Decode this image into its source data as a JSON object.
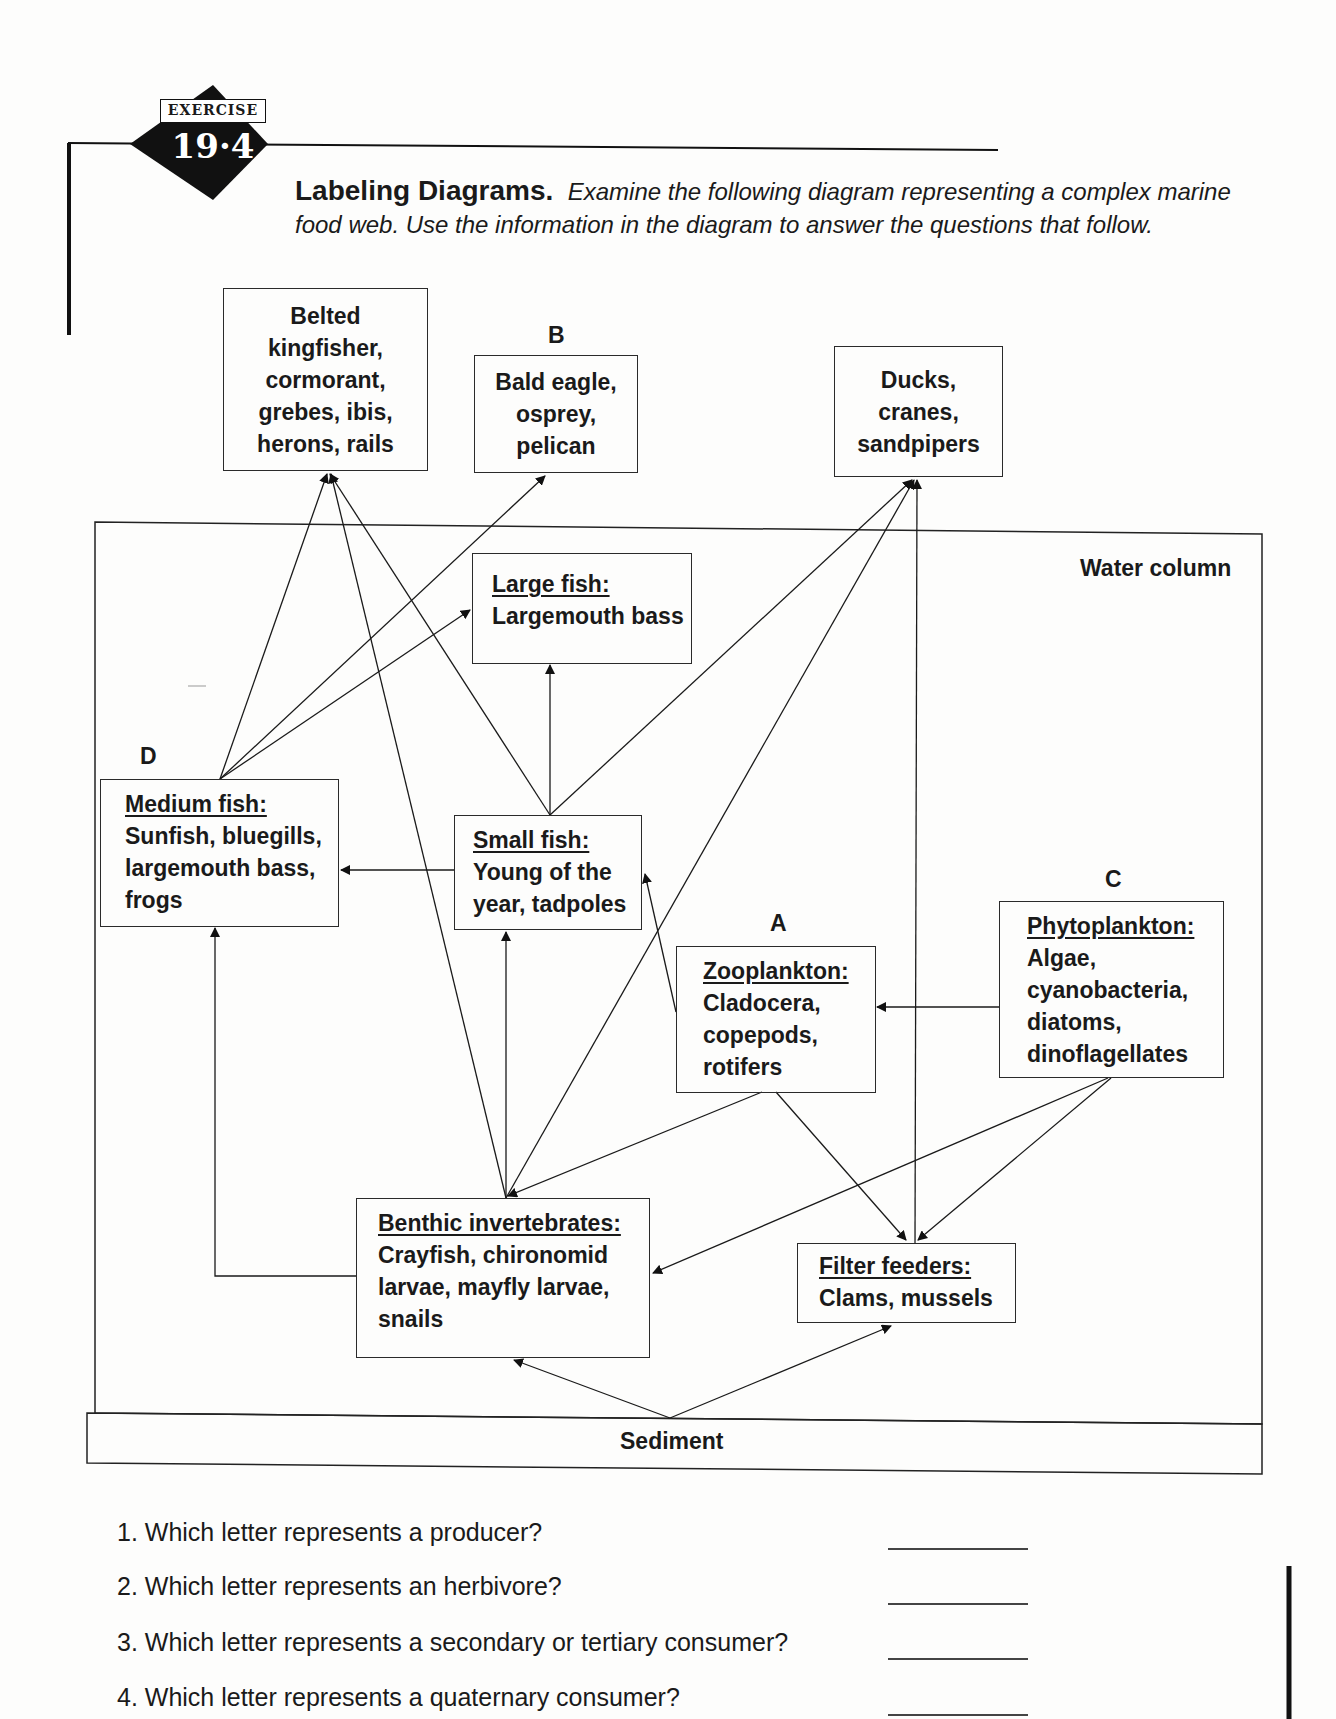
{
  "exercise": {
    "badge_label": "EXERCISE",
    "badge_number": "19·4"
  },
  "instructions": {
    "heading": "Labeling Diagrams.",
    "text": "Examine the following diagram representing a complex marine food web. Use the information in the diagram to answer the questions that follow."
  },
  "diagram": {
    "zones": {
      "water_column": "Water column",
      "sediment": "Sediment"
    },
    "letters": {
      "A": "A",
      "B": "B",
      "C": "C",
      "D": "D"
    },
    "nodes": {
      "belted": {
        "lines": [
          "Belted",
          "kingfisher,",
          "cormorant,",
          "grebes, ibis,",
          "herons, rails"
        ]
      },
      "bald_eagle": {
        "letter": "B",
        "lines": [
          "Bald eagle,",
          "osprey,",
          "pelican"
        ]
      },
      "ducks": {
        "lines": [
          "Ducks,",
          "cranes,",
          "sandpipers"
        ]
      },
      "large_fish": {
        "title": "Large fish:",
        "lines": [
          "Largemouth bass"
        ]
      },
      "medium_fish": {
        "letter": "D",
        "title": "Medium fish:",
        "lines": [
          "Sunfish, bluegills,",
          "largemouth bass,",
          "frogs"
        ]
      },
      "small_fish": {
        "title": "Small fish:",
        "lines": [
          "Young of the",
          "year, tadpoles"
        ]
      },
      "zooplankton": {
        "letter": "A",
        "title": "Zooplankton:",
        "lines": [
          "Cladocera,",
          "copepods,",
          "rotifers"
        ]
      },
      "phytoplankton": {
        "letter": "C",
        "title": "Phytoplankton:",
        "lines": [
          "Algae,",
          "cyanobacteria,",
          "diatoms,",
          "dinoflagellates"
        ]
      },
      "benthic": {
        "title": "Benthic invertebrates:",
        "lines": [
          "Crayfish, chironomid",
          "larvae, mayfly larvae,",
          "snails"
        ]
      },
      "filter": {
        "title": "Filter feeders:",
        "lines": [
          "Clams, mussels"
        ]
      }
    },
    "edges": [
      {
        "from": "medium_fish",
        "to": "belted"
      },
      {
        "from": "medium_fish",
        "to": "bald_eagle"
      },
      {
        "from": "medium_fish",
        "to": "large_fish"
      },
      {
        "from": "small_fish",
        "to": "belted"
      },
      {
        "from": "small_fish",
        "to": "large_fish"
      },
      {
        "from": "small_fish",
        "to": "ducks"
      },
      {
        "from": "small_fish",
        "to": "medium_fish"
      },
      {
        "from": "benthic",
        "to": "belted"
      },
      {
        "from": "benthic",
        "to": "small_fish"
      },
      {
        "from": "benthic",
        "to": "ducks"
      },
      {
        "from": "benthic",
        "to": "medium_fish"
      },
      {
        "from": "zooplankton",
        "to": "small_fish"
      },
      {
        "from": "zooplankton",
        "to": "benthic"
      },
      {
        "from": "zooplankton",
        "to": "filter"
      },
      {
        "from": "phytoplankton",
        "to": "zooplankton"
      },
      {
        "from": "phytoplankton",
        "to": "benthic"
      },
      {
        "from": "phytoplankton",
        "to": "filter"
      },
      {
        "from": "filter",
        "to": "ducks"
      },
      {
        "from": "sediment",
        "to": "benthic"
      },
      {
        "from": "sediment",
        "to": "filter"
      }
    ]
  },
  "questions": [
    {
      "number": "1.",
      "text": "Which letter represents a producer?",
      "answer": ""
    },
    {
      "number": "2.",
      "text": "Which letter represents an herbivore?",
      "answer": ""
    },
    {
      "number": "3.",
      "text": "Which letter represents a secondary or tertiary consumer?",
      "answer": ""
    },
    {
      "number": "4.",
      "text": "Which letter represents a quaternary consumer?",
      "answer": ""
    }
  ]
}
